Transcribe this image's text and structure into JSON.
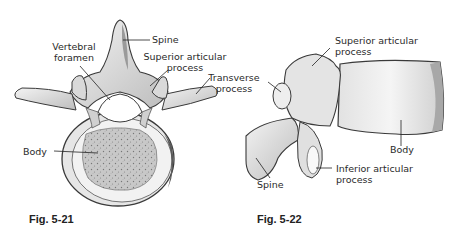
{
  "figures": [
    {
      "id": "fig-5-21",
      "caption": "Fig. 5-21",
      "view": "superior view of lumbar vertebra",
      "labels": {
        "spine": "Spine",
        "vertebral_foramen_1": "Vertebral",
        "vertebral_foramen_2": "foramen",
        "superior_articular_1": "Superior  articular",
        "superior_articular_2": "process",
        "transverse_1": "Transverse",
        "transverse_2": "process",
        "body": "Body"
      }
    },
    {
      "id": "fig-5-22",
      "caption": "Fig. 5-22",
      "view": "lateral view of lumbar vertebra",
      "labels": {
        "superior_articular_1": "Superior  articular",
        "superior_articular_2": "process",
        "body": "Body",
        "spine": "Spine",
        "inferior_articular_1": "Inferior  articular",
        "inferior_articular_2": "process"
      }
    }
  ],
  "colors": {
    "bone_light": "#ececec",
    "bone_mid": "#c9c9c9",
    "bone_dark": "#7a7a7a",
    "outline": "#3a3a3a",
    "text": "#2a2a2a",
    "background": "#ffffff"
  }
}
